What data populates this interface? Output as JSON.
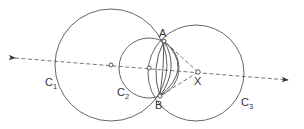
{
  "diagram": {
    "title": "",
    "points": {
      "A": {
        "label": "A",
        "x": 164,
        "y": 41
      },
      "B": {
        "label": "B",
        "x": 160,
        "y": 96
      },
      "X": {
        "label": "X",
        "x": 198,
        "y": 72
      },
      "O1": {
        "label": "",
        "x": 111,
        "y": 65
      },
      "O2": {
        "label": "",
        "x": 149,
        "y": 68
      }
    },
    "circles": [
      {
        "label": "C",
        "subscript": "1",
        "cx": 111,
        "cy": 65,
        "r": 56
      },
      {
        "label": "C",
        "subscript": "2",
        "cx": 149,
        "cy": 68,
        "r": 30
      },
      {
        "label": "C",
        "subscript": "3",
        "cx": 196,
        "cy": 73,
        "r": 48
      }
    ],
    "line": {
      "style": "dashed",
      "from": [
        13,
        58
      ],
      "to": [
        289,
        80
      ],
      "arrows": "both"
    },
    "colors": {
      "stroke": "#555555",
      "background": "#ffffff"
    }
  }
}
